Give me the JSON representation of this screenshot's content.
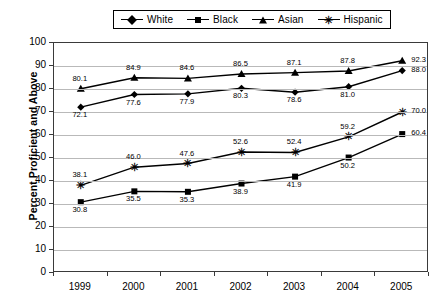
{
  "chart_data": {
    "type": "line",
    "title": "",
    "xlabel": "",
    "ylabel": "Percent Proficient and Above",
    "ylim": [
      0,
      100
    ],
    "ytick_step": 10,
    "ytick_labels": [
      "0",
      "10",
      "20",
      "30",
      "40",
      "50",
      "60",
      "70",
      "80",
      "90",
      "100"
    ],
    "grid": true,
    "legend_position": "top-center",
    "categories": [
      "1999",
      "2000",
      "2001",
      "2002",
      "2003",
      "2004",
      "2005"
    ],
    "series": [
      {
        "name": "White",
        "marker": "diamond",
        "label_position": "below",
        "values": [
          72.1,
          77.6,
          77.9,
          80.3,
          78.6,
          81.0,
          88.0
        ],
        "value_labels": [
          "72.1",
          "77.6",
          "77.9",
          "80.3",
          "78.6",
          "81.0",
          "88.0"
        ]
      },
      {
        "name": "Black",
        "marker": "square",
        "label_position": "below",
        "values": [
          30.8,
          35.5,
          35.3,
          38.9,
          41.9,
          50.2,
          60.4
        ],
        "value_labels": [
          "30.8",
          "35.5",
          "35.3",
          "38.9",
          "41.9",
          "50.2",
          "60.4"
        ]
      },
      {
        "name": "Asian",
        "marker": "triangle",
        "label_position": "above",
        "values": [
          80.1,
          84.9,
          84.6,
          86.5,
          87.1,
          87.8,
          92.3
        ],
        "value_labels": [
          "80.1",
          "84.9",
          "84.6",
          "86.5",
          "87.1",
          "87.8",
          "92.3"
        ]
      },
      {
        "name": "Hispanic",
        "marker": "star",
        "label_position": "above",
        "values": [
          38.1,
          46.0,
          47.6,
          52.6,
          52.4,
          59.2,
          70.0
        ],
        "value_labels": [
          "38.1",
          "46.0",
          "47.6",
          "52.6",
          "52.4",
          "59.2",
          "70.0"
        ]
      }
    ],
    "colors": {
      "series_line": "#000000",
      "gridline": "#b9b9b9",
      "axis": "#3a3a3a",
      "background": "#ffffff"
    }
  },
  "legend": {
    "items": [
      {
        "label": "White",
        "marker": "diamond",
        "glyph": ""
      },
      {
        "label": "Black",
        "marker": "square",
        "glyph": ""
      },
      {
        "label": "Asian",
        "marker": "triangle",
        "glyph": ""
      },
      {
        "label": "Hispanic",
        "marker": "star",
        "glyph": "✳"
      }
    ]
  }
}
